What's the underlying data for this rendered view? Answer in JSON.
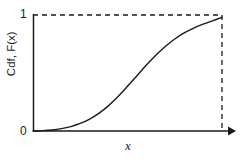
{
  "figure": {
    "background_color": "#ffffff",
    "width": 246,
    "height": 160
  },
  "axes": {
    "y_title": "Cdf, F(x)",
    "x_title": "x",
    "y_tick_top": "1",
    "y_tick_bottom": "0",
    "line_color": "#1a1a1a",
    "origin_px": {
      "x": 33,
      "y": 131
    },
    "x_end_px": 230,
    "y_top_px": 15
  },
  "guides": {
    "top_dashed": {
      "y_value": 1,
      "from_x_px": 33,
      "to_x_px": 222
    },
    "right_dashed": {
      "x_px": 222,
      "from_y_px": 15,
      "to_y_px": 131
    },
    "dash_pattern": "5,4",
    "color": "#1a1a1a"
  },
  "chart_data": {
    "type": "line",
    "title": "",
    "subtitle": "",
    "xlabel": "x",
    "ylabel": "Cdf, F(x)",
    "xlim": [
      0,
      1
    ],
    "ylim": [
      0,
      1
    ],
    "grid": false,
    "legend": null,
    "legend_position": "none",
    "xticks": [],
    "xticklabels": [],
    "yticks": [
      0,
      1
    ],
    "yticklabels": [
      "0",
      "1"
    ],
    "annotations": [
      {
        "text": "dashed asymptote at F(x) = 1",
        "type": "horizontal-dashed-line",
        "y": 1
      },
      {
        "text": "dashed vertical drop line at right edge",
        "type": "vertical-dashed-line",
        "x": 1.0
      },
      {
        "text": "arrowhead at right end of x-axis",
        "type": "axis-arrow"
      }
    ],
    "series": [
      {
        "name": "Cdf F(x)",
        "color": "#1a1a1a",
        "linewidth": 1.4,
        "style": "solid",
        "x": [
          0.0,
          0.05,
          0.1,
          0.15,
          0.2,
          0.25,
          0.3,
          0.35,
          0.4,
          0.45,
          0.5,
          0.55,
          0.6,
          0.65,
          0.7,
          0.75,
          0.8,
          0.85,
          0.9,
          0.95,
          1.0
        ],
        "y": [
          0.0,
          0.003,
          0.009,
          0.02,
          0.038,
          0.065,
          0.103,
          0.154,
          0.219,
          0.297,
          0.385,
          0.477,
          0.569,
          0.654,
          0.729,
          0.793,
          0.845,
          0.887,
          0.921,
          0.95,
          0.98
        ]
      }
    ]
  }
}
